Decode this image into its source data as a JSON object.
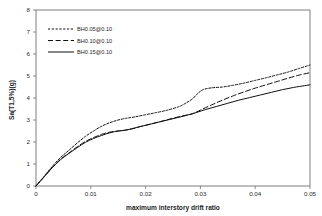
{
  "chart_data": {
    "type": "line",
    "title": "",
    "xlabel": "maximum interstory drift ratio",
    "ylabel": "Sa(T1,5%)(g)",
    "xlim": [
      0,
      0.05
    ],
    "ylim": [
      0,
      8
    ],
    "xticks": [
      "0",
      "0.01",
      "0.02",
      "0.03",
      "0.04",
      "0.05"
    ],
    "xtick_values": [
      0,
      0.01,
      0.02,
      0.03,
      0.04,
      0.05
    ],
    "yticks": [
      "0",
      "1",
      "2",
      "3",
      "4",
      "5",
      "6",
      "7",
      "8"
    ],
    "ytick_values": [
      0,
      1,
      2,
      3,
      4,
      5,
      6,
      7,
      8
    ],
    "grid": false,
    "legend_position": "top-left",
    "series": [
      {
        "name": "BH0.05@0.10",
        "style": "dotted",
        "color": "#111111",
        "x": [
          0,
          0.0015,
          0.003,
          0.0045,
          0.006,
          0.0075,
          0.009,
          0.0105,
          0.012,
          0.0135,
          0.015,
          0.0165,
          0.018,
          0.02,
          0.022,
          0.024,
          0.026,
          0.027,
          0.0285,
          0.0295,
          0.0305,
          0.032,
          0.034,
          0.036,
          0.038,
          0.04,
          0.042,
          0.044,
          0.046,
          0.048,
          0.05
        ],
        "y": [
          0,
          0.45,
          0.9,
          1.3,
          1.62,
          1.95,
          2.25,
          2.5,
          2.72,
          2.88,
          3.0,
          3.08,
          3.14,
          3.24,
          3.34,
          3.45,
          3.6,
          3.72,
          3.95,
          4.2,
          4.38,
          4.46,
          4.5,
          4.58,
          4.68,
          4.8,
          4.92,
          5.05,
          5.18,
          5.34,
          5.5
        ]
      },
      {
        "name": "BH0.10@0.10",
        "style": "dashed",
        "color": "#111111",
        "x": [
          0,
          0.0015,
          0.003,
          0.0045,
          0.006,
          0.0075,
          0.009,
          0.0105,
          0.012,
          0.0135,
          0.015,
          0.016,
          0.0175,
          0.019,
          0.021,
          0.023,
          0.025,
          0.027,
          0.0285,
          0.03,
          0.032,
          0.034,
          0.036,
          0.038,
          0.04,
          0.042,
          0.044,
          0.046,
          0.048,
          0.05
        ],
        "y": [
          0,
          0.42,
          0.85,
          1.22,
          1.5,
          1.78,
          2.02,
          2.2,
          2.35,
          2.45,
          2.5,
          2.52,
          2.6,
          2.7,
          2.82,
          2.95,
          3.08,
          3.2,
          3.28,
          3.45,
          3.68,
          3.9,
          4.1,
          4.28,
          4.45,
          4.6,
          4.75,
          4.9,
          5.04,
          5.15
        ]
      },
      {
        "name": "BH0.15@0.10",
        "style": "solid",
        "color": "#111111",
        "x": [
          0,
          0.0015,
          0.003,
          0.0045,
          0.006,
          0.0075,
          0.009,
          0.0105,
          0.012,
          0.0135,
          0.015,
          0.016,
          0.0175,
          0.019,
          0.021,
          0.023,
          0.025,
          0.027,
          0.029,
          0.031,
          0.033,
          0.035,
          0.037,
          0.039,
          0.041,
          0.043,
          0.045,
          0.047,
          0.049,
          0.05
        ],
        "y": [
          0,
          0.42,
          0.84,
          1.2,
          1.48,
          1.74,
          1.98,
          2.16,
          2.3,
          2.42,
          2.5,
          2.53,
          2.6,
          2.7,
          2.82,
          2.94,
          3.06,
          3.18,
          3.32,
          3.48,
          3.62,
          3.76,
          3.9,
          4.02,
          4.14,
          4.26,
          4.38,
          4.48,
          4.56,
          4.6
        ]
      }
    ]
  }
}
